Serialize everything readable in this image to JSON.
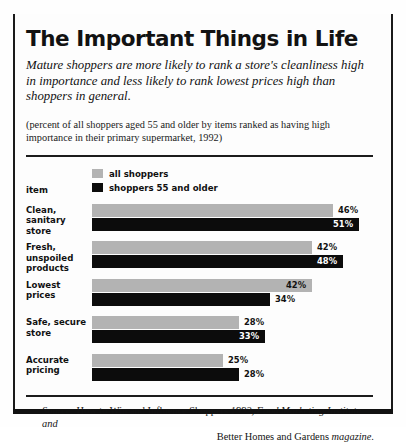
{
  "title": "The Important Things in Life",
  "deck": "Mature shoppers are more likely to rank a store's cleanliness high in importance and less likely to rank lowest prices high than shoppers in general.",
  "note": "(percent of all shoppers aged 55 and older by items ranked as having high importance in their primary supermarket, 1992)",
  "axis_label": "item",
  "legend": [
    {
      "label": "all  shoppers",
      "color": "#b3b3b3",
      "swatch": "light-gray-swatch"
    },
    {
      "label": "shoppers 55 and older",
      "color": "#0c0c0c",
      "swatch": "black-swatch"
    }
  ],
  "source": {
    "prefix": "Source:",
    "line1_roman": " How to Win and Influence Shoppers ",
    "line1_italic": "1992, Food Marketing Institute and",
    "line2_roman": "Better Homes and Gardens ",
    "line2_italic": "magazine."
  },
  "chart_data": {
    "type": "bar",
    "title": "The Important Things in Life",
    "xlabel": "",
    "ylabel": "item",
    "xlim": [
      0,
      55
    ],
    "grid": false,
    "legend_position": "top-left",
    "orientation": "horizontal",
    "value_suffix": "%",
    "categories": [
      "Clean, sanitary store",
      "Fresh, unspoiled products",
      "Lowest prices",
      "Safe, secure store",
      "Accurate pricing"
    ],
    "series": [
      {
        "name": "all  shoppers",
        "color": "#b3b3b3",
        "values": [
          46,
          42,
          42,
          28,
          25
        ]
      },
      {
        "name": "shoppers 55 and older",
        "color": "#0c0c0c",
        "values": [
          51,
          48,
          34,
          33,
          28
        ]
      }
    ],
    "labels": {
      "all_shoppers": [
        "46%",
        "42%",
        "42%",
        "28%",
        "25%"
      ],
      "shoppers_55_and_older": [
        "51%",
        "48%",
        "34%",
        "33%",
        "28%"
      ]
    }
  },
  "rows": [
    {
      "category_line1": "Clean, sanitary",
      "category_line2": "store",
      "light": {
        "value": 46,
        "text": "46%",
        "placement": "outside"
      },
      "dark": {
        "value": 51,
        "text": "51%",
        "placement": "inside"
      }
    },
    {
      "category_line1": "Fresh, unspoiled",
      "category_line2": "products",
      "light": {
        "value": 42,
        "text": "42%",
        "placement": "outside"
      },
      "dark": {
        "value": 48,
        "text": "48%",
        "placement": "inside"
      }
    },
    {
      "category_line1": "Lowest prices",
      "category_line2": "",
      "light": {
        "value": 42,
        "text": "42%",
        "placement": "inside"
      },
      "dark": {
        "value": 34,
        "text": "34%",
        "placement": "outside"
      }
    },
    {
      "category_line1": "Safe, secure",
      "category_line2": "store",
      "light": {
        "value": 28,
        "text": "28%",
        "placement": "outside"
      },
      "dark": {
        "value": 33,
        "text": "33%",
        "placement": "inside"
      }
    },
    {
      "category_line1": "Accurate",
      "category_line2": "pricing",
      "light": {
        "value": 25,
        "text": "25%",
        "placement": "outside"
      },
      "dark": {
        "value": 28,
        "text": "28%",
        "placement": "outside"
      }
    }
  ]
}
